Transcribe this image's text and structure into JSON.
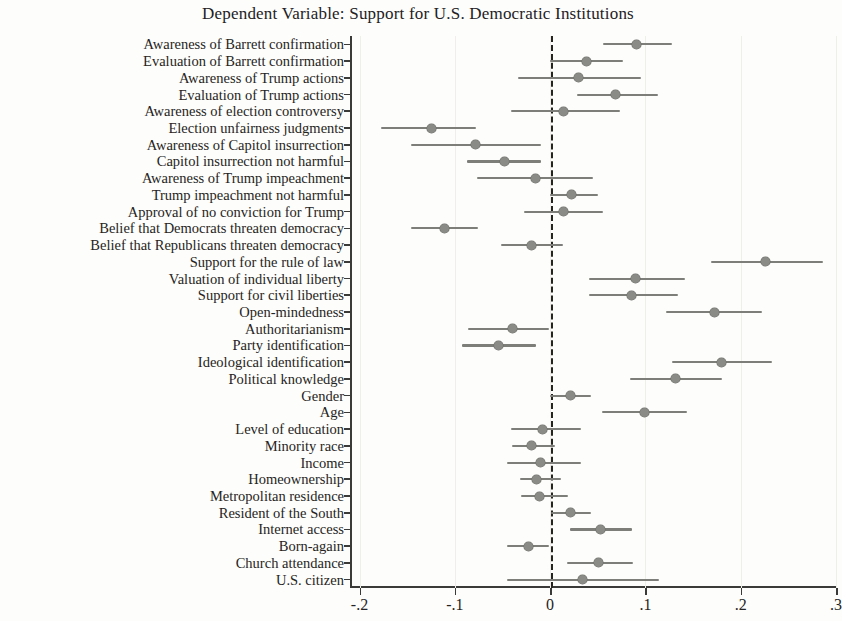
{
  "chart_data": {
    "type": "scatter",
    "title": "Dependent Variable: Support for U.S. Democratic Institutions",
    "xlabel": "",
    "ylabel": "",
    "xlim": [
      -0.21,
      0.3
    ],
    "xticks": [
      -0.2,
      -0.1,
      0,
      0.1,
      0.2,
      0.3
    ],
    "xticklabels": [
      "-.2",
      "-.1",
      "0",
      ".1",
      ".2",
      ".3"
    ],
    "grid": false,
    "reference_line": 0,
    "reference_line_style": "dashed",
    "legend": null,
    "marker_color": "#8a8a87",
    "line_color": "#7d7d7a",
    "categories": [
      "Awareness of Barrett confirmation",
      "Evaluation of Barrett confirmation",
      "Awareness of Trump actions",
      "Evaluation of Trump actions",
      "Awareness of election controversy",
      "Election unfairness judgments",
      "Awareness of Capitol insurrection",
      "Capitol insurrection not harmful",
      "Awareness of Trump impeachment",
      "Trump impeachment not harmful",
      "Approval of no conviction for Trump",
      "Belief that Democrats threaten democracy",
      "Belief that Republicans threaten democracy",
      "Support for the rule of law",
      "Valuation of individual liberty",
      "Support for civil liberties",
      "Open-mindedness",
      "Authoritarianism",
      "Party identification",
      "Ideological identification",
      "Political knowledge",
      "Gender",
      "Age",
      "Level of education",
      "Minority race",
      "Income",
      "Homeownership",
      "Metropolitan residence",
      "Resident of the South",
      "Internet access",
      "Born-again",
      "Church attendance",
      "U.S. citizen"
    ],
    "estimates": [
      0.091,
      0.038,
      0.03,
      0.069,
      0.014,
      -0.125,
      -0.078,
      -0.048,
      -0.015,
      0.022,
      0.014,
      -0.111,
      -0.02,
      0.226,
      0.09,
      0.085,
      0.172,
      -0.04,
      -0.054,
      0.18,
      0.132,
      0.021,
      0.099,
      -0.008,
      -0.02,
      -0.01,
      -0.014,
      -0.011,
      0.021,
      0.053,
      -0.023,
      0.051,
      0.034
    ],
    "ci_low": [
      0.055,
      0.0,
      -0.034,
      0.028,
      -0.041,
      -0.177,
      -0.146,
      -0.087,
      -0.077,
      0.0,
      -0.027,
      -0.146,
      -0.052,
      0.169,
      0.041,
      0.041,
      0.122,
      -0.086,
      -0.092,
      0.128,
      0.084,
      0.0,
      0.054,
      -0.041,
      -0.04,
      -0.045,
      -0.032,
      -0.031,
      0.001,
      0.021,
      -0.045,
      0.018,
      -0.045
    ],
    "ci_high": [
      0.128,
      0.076,
      0.095,
      0.113,
      0.073,
      -0.078,
      -0.01,
      -0.01,
      0.045,
      0.05,
      0.055,
      -0.076,
      0.013,
      0.286,
      0.142,
      0.134,
      0.222,
      -0.001,
      -0.015,
      0.233,
      0.18,
      0.043,
      0.144,
      0.032,
      0.005,
      0.032,
      0.011,
      0.019,
      0.043,
      0.086,
      -0.001,
      0.087,
      0.114
    ]
  }
}
